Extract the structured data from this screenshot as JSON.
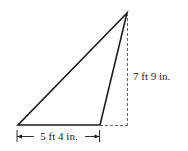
{
  "diagram": {
    "type": "obtuse-triangle-area",
    "colors": {
      "stroke": "#1a1a1a",
      "dashed": "#555555",
      "background": "#ffffff"
    },
    "vertices": {
      "top": [
        127,
        13
      ],
      "bottom_left": [
        18,
        125
      ],
      "bottom_right": [
        100,
        125
      ]
    },
    "height_foot": [
      127,
      125
    ],
    "labels": {
      "base": "5 ft 4 in.",
      "height": "7 ft 9 in."
    }
  }
}
